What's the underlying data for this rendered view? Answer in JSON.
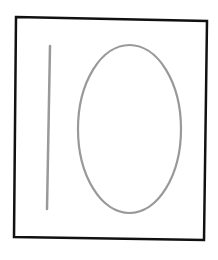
{
  "figure": {
    "colors": {
      "background": "#ffffff",
      "frame": "#111111",
      "shapes": "#999999"
    },
    "frame": {
      "points": "16,17 207,21 204,240 14,237"
    },
    "line": {
      "x1": 50,
      "y1": 46,
      "x2": 47,
      "y2": 209
    },
    "ellipse": {
      "cx": 129.5,
      "cy": 129,
      "rx": 51.5,
      "ry": 84
    }
  }
}
